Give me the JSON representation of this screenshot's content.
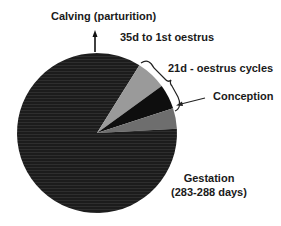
{
  "diagram": {
    "type": "pie-cycle",
    "labels": {
      "calving": "Calving (parturition)",
      "first_oestrus": "35d to 1st oestrus",
      "oestrus_cycles": "21d - oestrus cycles",
      "conception": "Conception",
      "gestation_title": "Gestation",
      "gestation_days": "(283-288 days)"
    },
    "segments": [
      {
        "name": "35d to 1st oestrus",
        "start_deg": 0,
        "end_deg": 32,
        "color": "#1c1c1c"
      },
      {
        "name": "21d oestrus cycle 1",
        "start_deg": 32,
        "end_deg": 54,
        "color": "#9a9a9a"
      },
      {
        "name": "21d oestrus cycle 2",
        "start_deg": 54,
        "end_deg": 72,
        "color": "#0e0e0e"
      },
      {
        "name": "21d oestrus cycle 3",
        "start_deg": 72,
        "end_deg": 87,
        "color": "#6e6e6e"
      },
      {
        "name": "Gestation (283-288 days)",
        "start_deg": 87,
        "end_deg": 360,
        "color": "#1c1c1c"
      }
    ]
  }
}
